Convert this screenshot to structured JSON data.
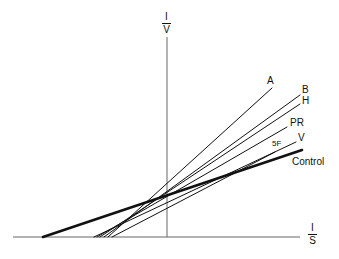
{
  "chart_data": {
    "type": "line",
    "title": "",
    "xlabel": "1/S",
    "ylabel": "1/V",
    "ylabel_top": "I",
    "ylabel_bottom": "V",
    "xlabel_top": "I",
    "xlabel_bottom": "S",
    "grid": false,
    "legend_position": "inline labels at line ends",
    "axes": {
      "x_axis": {
        "x1": 13,
        "x2": 300,
        "y": 237
      },
      "y_axis": {
        "x": 167,
        "y1": 37,
        "y2": 237
      }
    },
    "series": [
      {
        "name": "A",
        "label": "A",
        "start": [
          108,
          237
        ],
        "end": [
          272,
          88
        ],
        "weight": "thin"
      },
      {
        "name": "B",
        "label": "B",
        "start": [
          104,
          237
        ],
        "end": [
          300,
          95
        ],
        "weight": "thin"
      },
      {
        "name": "H",
        "label": "H",
        "start": [
          100,
          237
        ],
        "end": [
          300,
          104
        ],
        "weight": "thin"
      },
      {
        "name": "PR",
        "label": "PR",
        "start": [
          97,
          237
        ],
        "end": [
          287,
          127
        ],
        "weight": "thin"
      },
      {
        "name": "V",
        "label": "V",
        "start": [
          94,
          237
        ],
        "end": [
          296,
          142
        ],
        "weight": "thin"
      },
      {
        "name": "5F",
        "label": "5F",
        "start": [
          112,
          237
        ],
        "end": [
          275,
          152
        ],
        "weight": "thin"
      },
      {
        "name": "Control",
        "label": "Control",
        "start": [
          43,
          237
        ],
        "end": [
          302,
          150
        ],
        "weight": "thick"
      }
    ],
    "labels": [
      {
        "text": "A",
        "x": 267,
        "y": 76
      },
      {
        "text": "B",
        "x": 302,
        "y": 85
      },
      {
        "text": "H",
        "x": 302,
        "y": 96
      },
      {
        "text": "PR",
        "x": 290,
        "y": 118
      },
      {
        "text": "V",
        "x": 298,
        "y": 133
      },
      {
        "text": "5F",
        "x": 272,
        "y": 140
      },
      {
        "text": "Control",
        "x": 292,
        "y": 157
      }
    ],
    "line_color": "#111111",
    "axis_color": "#555555"
  }
}
